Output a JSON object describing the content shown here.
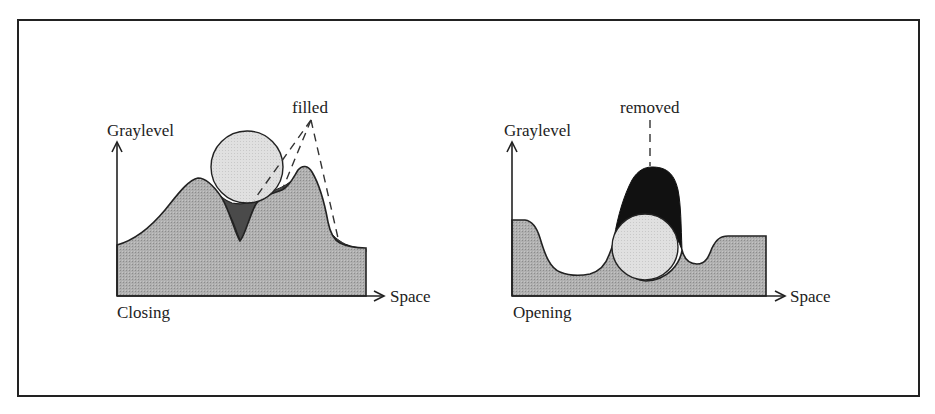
{
  "figure": {
    "panels": [
      {
        "id": "closing",
        "title": "Closing",
        "y_axis_label": "Graylevel",
        "x_axis_label": "Space",
        "annotation": "filled",
        "annotation_pointers": 3
      },
      {
        "id": "opening",
        "title": "Opening",
        "y_axis_label": "Graylevel",
        "x_axis_label": "Space",
        "annotation": "removed",
        "annotation_pointers": 1
      }
    ],
    "colors": {
      "signal_fill": "#a9a9a9",
      "structuring_element_fill": "#dcdcdc",
      "closing_filled_region": "#4a4a4a",
      "opening_removed_region": "#111111",
      "outline": "#222222",
      "frame": "#222222"
    }
  }
}
